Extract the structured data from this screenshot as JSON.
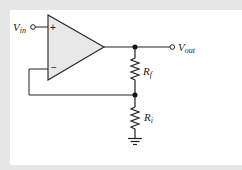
{
  "diagram": {
    "labels": {
      "vin_main": "V",
      "vin_sub": "in",
      "vout_main": "V",
      "vout_sub": "out",
      "rf_main": "R",
      "rf_sub": "f",
      "ri_main": "R",
      "ri_sub": "i",
      "plus": "+",
      "minus": "−"
    },
    "colors": {
      "background": "#e6e6e6",
      "panel": "#ffffff",
      "opamp_fill": "#e8e8e8",
      "wire": "#222222"
    }
  }
}
